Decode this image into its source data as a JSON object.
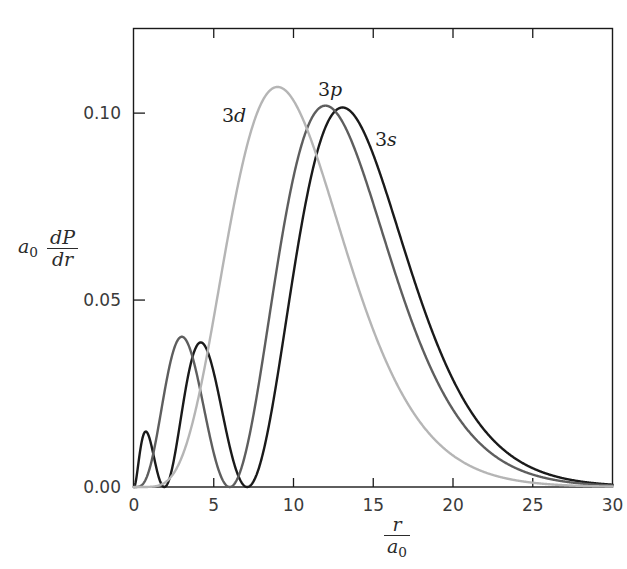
{
  "figure": {
    "background": "#ffffff",
    "frame_color": "#1a1a1a"
  },
  "axes": {
    "x": {
      "label_numerator": "r",
      "label_denominator": "a",
      "label_denominator_sub": "0",
      "ticks": [
        0,
        5,
        10,
        15,
        20,
        25,
        30
      ],
      "tick_labels": [
        "0",
        "5",
        "10",
        "15",
        "20",
        "25",
        "30"
      ],
      "min": 0,
      "max": 30
    },
    "y": {
      "label_prefix": "a",
      "label_prefix_sub": "0",
      "label_numerator": "dP",
      "label_denominator": "dr",
      "ticks": [
        0.0,
        0.05,
        0.1
      ],
      "tick_labels": [
        "0.00",
        "0.05",
        "0.10"
      ],
      "min": 0,
      "max": 0.1225
    }
  },
  "curve_labels": [
    {
      "name": "label-3d",
      "digit": "3",
      "orbital": "d"
    },
    {
      "name": "label-3p",
      "digit": "3",
      "orbital": "p"
    },
    {
      "name": "label-3s",
      "digit": "3",
      "orbital": "s"
    }
  ],
  "chart_data": {
    "type": "line",
    "title": "",
    "xlabel": "r/a0",
    "ylabel": "a0 dP/dr",
    "xlim": [
      0,
      30
    ],
    "ylim": [
      0,
      0.1225
    ],
    "grid": false,
    "legend": "inline-curve-labels",
    "x_ticks": [
      0,
      5,
      10,
      15,
      20,
      25,
      30
    ],
    "y_ticks": [
      0.0,
      0.05,
      0.1
    ],
    "series": [
      {
        "name": "3s",
        "label": "3s",
        "color": "#1a1a1a",
        "line_width": 2.4,
        "nodes": [
          1.9,
          7.1
        ],
        "peaks": [
          {
            "x": 0.75,
            "y": 0.0175
          },
          {
            "x": 4.2,
            "y": 0.0375
          },
          {
            "x": 13.1,
            "y": 0.1015
          }
        ],
        "formula": "4/(243) * (6 - 6*(2r/3) + (2r/3)^2)^2 * (2r/3)^2 * exp(-2r/3) / 27 * r^2 form",
        "x": [
          0,
          0.5,
          0.75,
          1,
          1.5,
          1.9,
          2.5,
          3,
          3.5,
          4.2,
          5,
          6,
          7.1,
          8,
          9,
          10,
          11,
          12,
          13.1,
          14,
          15,
          16,
          17,
          18,
          19,
          20,
          21,
          22,
          23,
          24,
          25,
          26,
          27,
          28,
          29,
          30
        ],
        "y": [
          0,
          0.0148,
          0.0175,
          0.0168,
          0.0083,
          0.0,
          0.0105,
          0.0231,
          0.0326,
          0.0375,
          0.0335,
          0.0162,
          0.0,
          0.0123,
          0.036,
          0.063,
          0.0858,
          0.098,
          0.1015,
          0.0985,
          0.089,
          0.0762,
          0.0625,
          0.0494,
          0.0378,
          0.028,
          0.0202,
          0.0142,
          0.0098,
          0.0066,
          0.0044,
          0.0029,
          0.0018,
          0.0011,
          0.0007,
          0.0004
        ]
      },
      {
        "name": "3p",
        "label": "3p",
        "color": "#5e5e5e",
        "line_width": 2.4,
        "nodes": [
          6.0
        ],
        "peaks": [
          {
            "x": 3.0,
            "y": 0.038
          },
          {
            "x": 12.0,
            "y": 0.102
          }
        ],
        "x": [
          0,
          0.5,
          1,
          1.5,
          2,
          2.5,
          3,
          3.5,
          4,
          4.5,
          5,
          5.5,
          6,
          6.5,
          7,
          8,
          9,
          10,
          11,
          12,
          13,
          14,
          15,
          16,
          17,
          18,
          19,
          20,
          21,
          22,
          23,
          24,
          25,
          26,
          27,
          28,
          29,
          30
        ],
        "y": [
          0,
          0.0042,
          0.0145,
          0.0258,
          0.034,
          0.0375,
          0.038,
          0.0358,
          0.0312,
          0.025,
          0.018,
          0.0088,
          0.0,
          0.01,
          0.022,
          0.048,
          0.0718,
          0.089,
          0.099,
          0.102,
          0.0995,
          0.093,
          0.084,
          0.0735,
          0.0622,
          0.0512,
          0.041,
          0.032,
          0.0245,
          0.0183,
          0.0134,
          0.0096,
          0.0068,
          0.0047,
          0.0032,
          0.0021,
          0.0014,
          0.0009
        ]
      },
      {
        "name": "3d",
        "label": "3d",
        "color": "#b5b5b5",
        "line_width": 2.4,
        "nodes": [],
        "peaks": [
          {
            "x": 9.0,
            "y": 0.107
          }
        ],
        "x": [
          0,
          1,
          2,
          3,
          4,
          5,
          6,
          7,
          8,
          9,
          10,
          11,
          12,
          13,
          14,
          15,
          16,
          17,
          18,
          19,
          20,
          21,
          22,
          23,
          24,
          25,
          26,
          27,
          28,
          29,
          30
        ],
        "y": [
          0,
          0.0008,
          0.0058,
          0.0172,
          0.035,
          0.0555,
          0.0755,
          0.0925,
          0.104,
          0.107,
          0.105,
          0.098,
          0.088,
          0.0765,
          0.0645,
          0.053,
          0.0425,
          0.0335,
          0.0258,
          0.0195,
          0.0145,
          0.0106,
          0.0076,
          0.0054,
          0.0037,
          0.0026,
          0.0017,
          0.0012,
          0.0008,
          0.0005,
          0.0003
        ]
      }
    ]
  }
}
